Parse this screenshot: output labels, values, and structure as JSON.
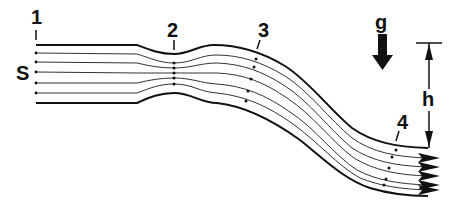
{
  "diagram": {
    "labels": {
      "section_1": "1",
      "section_2": "2",
      "section_3": "3",
      "section_4": "4",
      "source": "S",
      "gravity": "g",
      "height": "h"
    },
    "colors": {
      "line": "#111111",
      "streamline": "#333333",
      "background": "#ffffff"
    },
    "streamline_count": 5,
    "icons": {
      "gravity_arrow": "down-arrow-icon",
      "height_dimension": "double-arrow-dimension-icon",
      "flow_arrows": "arrowhead-icon"
    }
  }
}
